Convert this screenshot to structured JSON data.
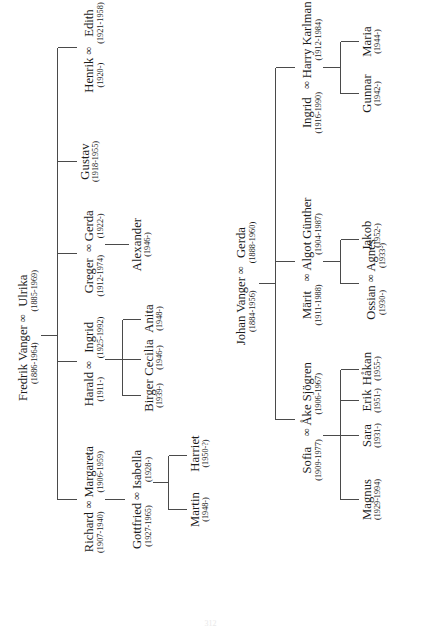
{
  "document": {
    "type": "genealogy-chart",
    "title": "Vanger Family Tree",
    "folio": "312"
  },
  "symbols": {
    "marriage": "∞"
  },
  "trees": [
    {
      "id": "fredrik-branch",
      "root": {
        "id": "fredrik-ulrika",
        "kind": "couple",
        "left_name": "Fredrik Vanger",
        "left_dates": "(1886-1964)",
        "right_name": "Ulrika",
        "right_dates": "(1885-1969)"
      },
      "children": [
        {
          "id": "richard-margareta",
          "kind": "couple",
          "left_name": "Richard",
          "left_dates": "(1907-1940)",
          "right_name": "Margareta",
          "right_dates": "(1906-1959)",
          "children": [
            {
              "id": "gottfried-isabella",
              "kind": "couple",
              "left_name": "Gottfried",
              "left_dates": "(1927-1965)",
              "right_name": "Isabella",
              "right_dates": "(1928-)",
              "children": [
                {
                  "id": "martin",
                  "kind": "person",
                  "name": "Martin",
                  "dates": "(1948-)"
                },
                {
                  "id": "harriet",
                  "kind": "person",
                  "name": "Harriet",
                  "dates": "(1950-?)"
                }
              ]
            }
          ]
        },
        {
          "id": "harald-ingrid",
          "kind": "couple",
          "left_name": "Harald",
          "left_dates": "(1911-)",
          "right_name": "Ingrid",
          "right_dates": "(1925-1992)",
          "children": [
            {
              "id": "birger",
              "kind": "person",
              "name": "Birger",
              "dates": "(1939-)"
            },
            {
              "id": "cecilia",
              "kind": "person",
              "name": "Cecilia",
              "dates": "(1946-)"
            },
            {
              "id": "anita",
              "kind": "person",
              "name": "Anita",
              "dates": "(1948-)"
            }
          ]
        },
        {
          "id": "greger-gerda",
          "kind": "couple",
          "left_name": "Greger",
          "left_dates": "(1912-1974)",
          "right_name": "Gerda",
          "right_dates": "(1922-)",
          "children": [
            {
              "id": "alexander",
              "kind": "person",
              "name": "Alexander",
              "dates": "(1946-)"
            }
          ]
        },
        {
          "id": "gustav",
          "kind": "person",
          "name": "Gustav",
          "dates": "(1918-1955)"
        },
        {
          "id": "henrik-edith",
          "kind": "couple",
          "left_name": "Henrik",
          "left_dates": "(1920-)",
          "right_name": "Edith",
          "right_dates": "(1921-1958)"
        }
      ]
    },
    {
      "id": "johan-branch",
      "root": {
        "id": "johan-gerda",
        "kind": "couple",
        "left_name": "Johan Vanger",
        "left_dates": "(1884-1956)",
        "right_name": "Gerda",
        "right_dates": "(1888-1960)"
      },
      "children": [
        {
          "id": "sofia-ake",
          "kind": "couple",
          "left_name": "Sofia",
          "left_dates": "(1909-1977)",
          "right_name": "Åke Sjögren",
          "right_dates": "(1906-1967)",
          "children": [
            {
              "id": "magnus",
              "kind": "person",
              "name": "Magnus",
              "dates": "(1929-1994)"
            },
            {
              "id": "sara",
              "kind": "person",
              "name": "Sara",
              "dates": "(1931-)"
            },
            {
              "id": "erik",
              "kind": "person",
              "name": "Erik",
              "dates": "(1951-)"
            },
            {
              "id": "hakan",
              "kind": "person",
              "name": "Håkan",
              "dates": "(1955-)"
            }
          ]
        },
        {
          "id": "marit-algot",
          "kind": "couple",
          "left_name": "Märit",
          "left_dates": "(1911-1988)",
          "right_name": "Algot Günther",
          "right_dates": "(1904-1987)",
          "children": [
            {
              "id": "ossian-agnes",
              "kind": "couple",
              "left_name": "Ossian",
              "left_dates": "(1930-)",
              "right_name": "Agnes",
              "right_dates": "(1933-)",
              "children": [
                {
                  "id": "jakob",
                  "kind": "person",
                  "name": "Jakob",
                  "dates": "(1952-)"
                }
              ]
            }
          ]
        },
        {
          "id": "ingrid-harry",
          "kind": "couple",
          "left_name": "Ingrid",
          "left_dates": "(1916-1990)",
          "right_name": "Harry Karlman",
          "right_dates": "(1912-1984)",
          "children": [
            {
              "id": "gunnar",
              "kind": "person",
              "name": "Gunnar",
              "dates": "(1942-)"
            },
            {
              "id": "maria",
              "kind": "person",
              "name": "Maria",
              "dates": "(1944-)"
            }
          ]
        }
      ]
    }
  ],
  "labels": {
    "fredrik_root": "Fredrik Vanger ∞ Ulrika",
    "johan_root": "Johan Vanger ∞ Gerda"
  }
}
